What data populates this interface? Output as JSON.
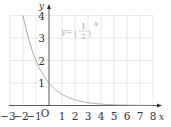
{
  "chart_data": {
    "type": "line",
    "title": "",
    "xlabel": "x",
    "ylabel": "y",
    "origin_label": "O",
    "xlim": [
      -3,
      8
    ],
    "ylim": [
      0,
      4
    ],
    "grid": true,
    "x_ticks": [
      "-3",
      "-2",
      "-1",
      "1",
      "2",
      "3",
      "4",
      "5",
      "6",
      "7",
      "8"
    ],
    "y_ticks": [
      "1",
      "2",
      "3",
      "4"
    ],
    "series": [
      {
        "name": "y = (1/2)^x",
        "x": [
          -2,
          -1,
          0,
          1,
          2,
          3,
          4,
          5,
          6,
          7,
          8
        ],
        "values": [
          4,
          2,
          1,
          0.5,
          0.25,
          0.125,
          0.0625,
          0.03125,
          0.015625,
          0.0078,
          0.0039
        ]
      }
    ],
    "annotation": {
      "text_prefix": "y=",
      "fraction_num": "1",
      "fraction_den": "2",
      "exponent": "x"
    },
    "colors": {
      "curve": "#9a9a9a",
      "grid": "#d8d8d8",
      "axis": "#333333",
      "annotation": "#b0b0b0"
    }
  }
}
